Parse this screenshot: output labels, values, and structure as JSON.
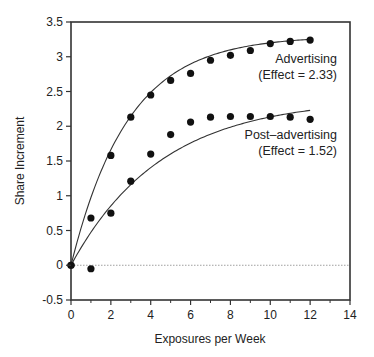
{
  "chart_data": {
    "type": "scatter",
    "title": "",
    "xlabel": "Exposures per Week",
    "ylabel": "Share Increment",
    "xlim": [
      0,
      14
    ],
    "ylim": [
      -0.5,
      3.5
    ],
    "xticks": [
      0,
      2,
      4,
      6,
      8,
      10,
      12,
      14
    ],
    "xticks_minor": [
      1,
      3,
      5,
      7,
      9,
      11,
      13
    ],
    "yticks": [
      -0.5,
      0,
      0.5,
      1,
      1.5,
      2,
      2.5,
      3,
      3.5
    ],
    "xtick_labels": [
      "0",
      "2",
      "4",
      "6",
      "8",
      "10",
      "12",
      "14"
    ],
    "ytick_labels": [
      "-0.5",
      "0",
      "0.5",
      "1",
      "1.5",
      "2",
      "2.5",
      "3",
      "3.5"
    ],
    "grid": false,
    "reference_line": {
      "y": 0,
      "style": "dotted"
    },
    "series": [
      {
        "name": "Advertising",
        "annotation": [
          "Advertising",
          "(Effect = 2.33)"
        ],
        "x": [
          0,
          1,
          2,
          3,
          4,
          5,
          6,
          7,
          8,
          9,
          10,
          11,
          12
        ],
        "values": [
          0,
          0.68,
          1.58,
          2.13,
          2.45,
          2.66,
          2.76,
          2.95,
          3.02,
          3.09,
          3.19,
          3.22,
          3.24
        ],
        "fit": {
          "asymptote": 3.3,
          "rate": 0.35,
          "x_end": 12
        }
      },
      {
        "name": "Post-advertising",
        "annotation": [
          "Post–advertising",
          "(Effect = 1.52)"
        ],
        "x": [
          0,
          1,
          2,
          3,
          4,
          5,
          6,
          7,
          8,
          9,
          10,
          11,
          12
        ],
        "values": [
          0,
          -0.05,
          0.75,
          1.21,
          1.6,
          1.88,
          2.06,
          2.13,
          2.14,
          2.14,
          2.14,
          2.13,
          2.1
        ],
        "fit": {
          "asymptote": 2.4,
          "rate": 0.22,
          "x_end": 12
        }
      }
    ]
  }
}
